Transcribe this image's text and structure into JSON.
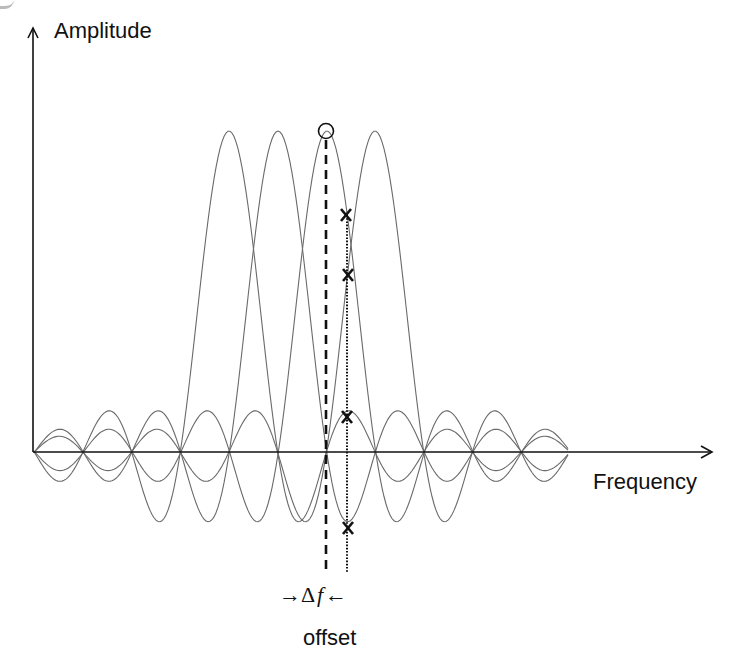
{
  "labels": {
    "y_axis": "Amplitude",
    "x_axis": "Frequency",
    "delta_prefix": "→Δ",
    "delta_var": "f",
    "delta_suffix": "←",
    "offset": "offset"
  },
  "colors": {
    "axis": "#111111",
    "curve": "#6a6a6a",
    "marker": "#111111"
  },
  "chart_data": {
    "type": "line",
    "title": "",
    "xlabel": "Frequency",
    "ylabel": "Amplitude",
    "geometry": {
      "origin_px": [
        33,
        452
      ],
      "y_axis_top_px": 28,
      "x_axis_right_px": 712,
      "curve_x_range_px": [
        34,
        569
      ],
      "subcarrier_spacing_px": 48.7,
      "peak_height_px": 321
    },
    "series": [
      {
        "name": "subcarrier 1",
        "center_px": 229
      },
      {
        "name": "subcarrier 2",
        "center_px": 278
      },
      {
        "name": "subcarrier 3",
        "center_px": 327
      },
      {
        "name": "subcarrier 4",
        "center_px": 375
      }
    ],
    "annotations": {
      "circled_peak_px": [
        326,
        131
      ],
      "dashed_line_x_px": 326,
      "dotted_line_x_px": 347,
      "lines_y_range_px": [
        140,
        573
      ],
      "x_markers_px": [
        [
          346,
          215
        ],
        [
          348,
          275
        ],
        [
          347,
          417
        ],
        [
          348,
          528
        ]
      ],
      "offset_label": "Δf offset"
    }
  }
}
